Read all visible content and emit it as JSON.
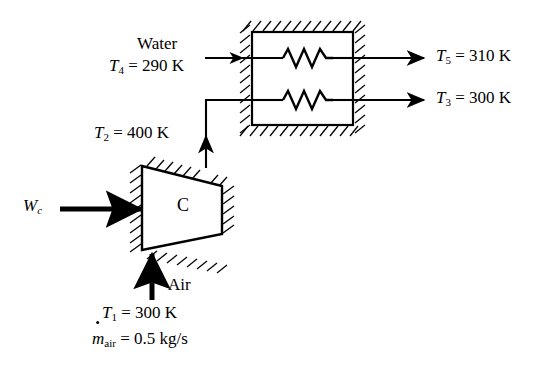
{
  "figure": {
    "type": "thermodynamic-process-schematic",
    "background_color": "#ffffff",
    "line_color": "#000000"
  },
  "components": {
    "compressor": {
      "label": "C",
      "shape": "trapezoid",
      "name": "compressor"
    },
    "heat_exchanger": {
      "name": "heat-exchanger",
      "shape": "rectangle",
      "coil_count": 2
    }
  },
  "streams": {
    "work_input": {
      "label_main": "W",
      "label_sub": "c",
      "direction": "right"
    },
    "air_inlet": {
      "fluid": "Air",
      "temperature_main": "T",
      "temperature_sub": "1",
      "temperature_value": "= 300 K",
      "mass_flow_main": "m",
      "mass_flow_sub": "air",
      "mass_flow_value": "= 0.5 kg/s",
      "direction": "up"
    },
    "compressor_outlet": {
      "temperature_main": "T",
      "temperature_sub": "2",
      "temperature_value": "= 400 K",
      "direction": "up-then-right"
    },
    "water_inlet": {
      "fluid": "Water",
      "temperature_main": "T",
      "temperature_sub": "4",
      "temperature_value": "= 290 K",
      "direction": "right"
    },
    "water_outlet": {
      "temperature_main": "T",
      "temperature_sub": "5",
      "temperature_value": "= 310 K",
      "direction": "right"
    },
    "air_outlet": {
      "temperature_main": "T",
      "temperature_sub": "3",
      "temperature_value": "= 300 K",
      "direction": "right"
    }
  }
}
